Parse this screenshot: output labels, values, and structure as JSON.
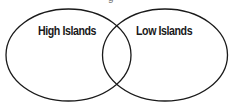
{
  "diagram": {
    "type": "venn",
    "sets": [
      {
        "id": "left",
        "label": "High Islands"
      },
      {
        "id": "right",
        "label": "Low Islands"
      }
    ],
    "colors": {
      "stroke": "#1a1a1a",
      "background": "#ffffff",
      "text": "#1a1a1a"
    },
    "top_cut_text": "g"
  }
}
